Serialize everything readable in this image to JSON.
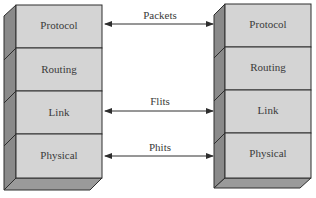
{
  "left_stack": {
    "layers": [
      "Protocol",
      "Routing",
      "Link",
      "Physical"
    ]
  },
  "right_stack": {
    "layers": [
      "Protocol",
      "Routing",
      "Link",
      "Physical"
    ]
  },
  "connections": [
    {
      "label": "Packets",
      "between": "Protocol"
    },
    {
      "label": "Flits",
      "between": "Link"
    },
    {
      "label": "Phits",
      "between": "Physical"
    }
  ],
  "colors": {
    "front": "#d4d4d4",
    "side": "#8a8a8a",
    "bottom": "#9a9a9a",
    "line": "#2e2e2e"
  }
}
